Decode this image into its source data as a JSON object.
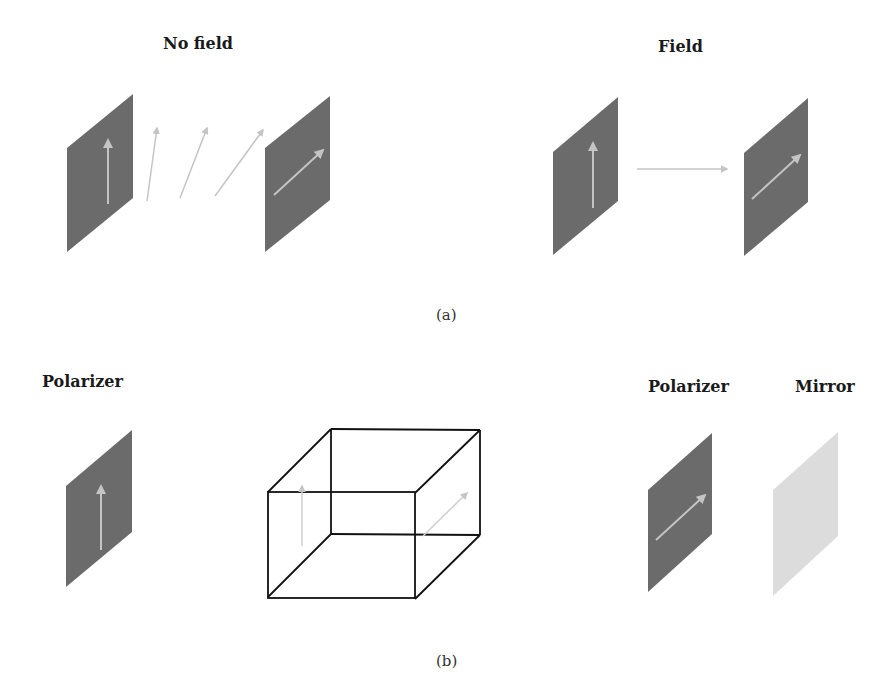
{
  "panel_a": {
    "left": {
      "title": "No field"
    },
    "right": {
      "title": "Field"
    },
    "caption": "(a)"
  },
  "panel_b": {
    "left_label": "Polarizer",
    "right_labels": [
      "Polarizer",
      "Mirror"
    ],
    "caption": "(b)"
  },
  "colors": {
    "polarizer_fill": "#6b6b6b",
    "mirror_fill": "#dcdcdc",
    "arrow": "#c4c4c4",
    "box_stroke": "#111111"
  }
}
